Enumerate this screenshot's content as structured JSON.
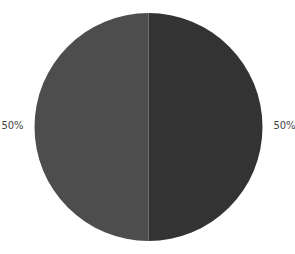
{
  "chart_data": {
    "type": "pie",
    "title": "",
    "categories": [
      "Slice A",
      "Slice B"
    ],
    "values": [
      50,
      50
    ],
    "labels": [
      "50%",
      "50%"
    ],
    "colors": [
      "#333333",
      "#4d4d4d"
    ],
    "legend": "none",
    "start_angle_deg": 0,
    "direction": "clockwise"
  }
}
